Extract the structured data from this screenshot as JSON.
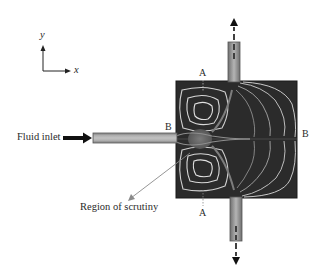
{
  "diagram": {
    "type": "flow-chamber-streamlines",
    "axes": {
      "y_label": "y",
      "x_label": "x"
    },
    "labels": {
      "inlet": "Fluid inlet",
      "region": "Region of scrutiny",
      "section_a_top": "A",
      "section_a_bottom": "A",
      "section_b_left": "B",
      "section_b_right": "B"
    },
    "components": {
      "inlet_pipe": "horizontal inlet channel from left",
      "chamber": "square chamber with four recirculation vortices",
      "top_outlet": "vertical outlet channel upward",
      "bottom_outlet": "vertical outlet channel downward"
    },
    "colors": {
      "chamber_fill": "#2b2b2b",
      "streamline": "#d8d8d8",
      "pipe_fill": "#9a9a9a",
      "arrow": "#111111",
      "leader": "#8a8a8a"
    }
  }
}
